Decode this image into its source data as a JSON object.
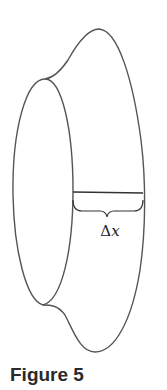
{
  "figure": {
    "caption": "Figure 5",
    "label_delta": "Δ",
    "label_var": "x",
    "stroke_color": "#555555"
  }
}
